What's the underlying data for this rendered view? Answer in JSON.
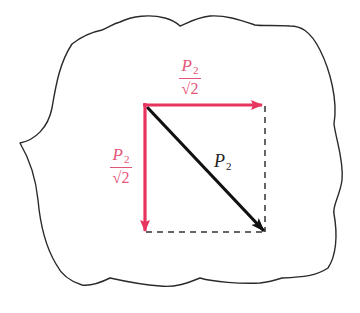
{
  "diagram": {
    "title": "",
    "colors": {
      "outline": "#2a2a2a",
      "component_arrow": "#e8355f",
      "component_label": "#e4557a",
      "resultant_arrow": "#111111",
      "dashed_line": "#333333",
      "background": "#ffffff"
    },
    "labels": {
      "horizontal_component": {
        "numerator": "P",
        "subscript": "2",
        "denominator": "√2"
      },
      "vertical_component": {
        "numerator": "P",
        "subscript": "2",
        "denominator": "√2"
      },
      "resultant": {
        "symbol": "P",
        "subscript": "2"
      }
    },
    "elements": [
      {
        "type": "outline",
        "shape": "irregular wavy closed boundary with a cusp on the left side"
      },
      {
        "type": "arrow",
        "name": "horizontal-component",
        "from": [
          145,
          105
        ],
        "to": [
          265,
          105
        ],
        "color": "component_arrow"
      },
      {
        "type": "arrow",
        "name": "vertical-component",
        "from": [
          145,
          105
        ],
        "to": [
          145,
          232
        ],
        "color": "component_arrow"
      },
      {
        "type": "arrow",
        "name": "resultant",
        "from": [
          145,
          105
        ],
        "to": [
          265,
          232
        ],
        "color": "resultant_arrow"
      },
      {
        "type": "dashed-line",
        "name": "right-edge",
        "from": [
          265,
          105
        ],
        "to": [
          265,
          232
        ]
      },
      {
        "type": "dashed-line",
        "name": "bottom-edge",
        "from": [
          145,
          232
        ],
        "to": [
          265,
          232
        ]
      }
    ]
  }
}
